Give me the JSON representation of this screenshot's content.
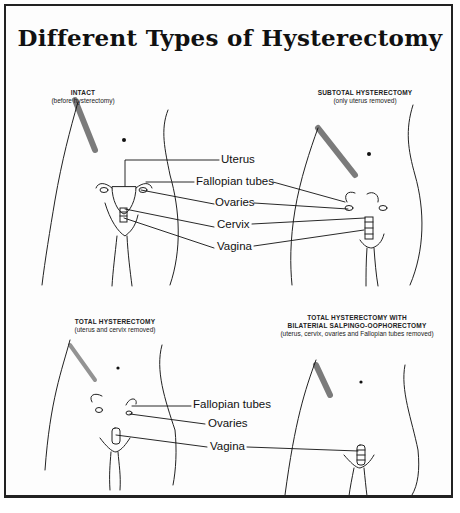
{
  "title": "Different Types of Hysterectomy",
  "panels": [
    {
      "heading": "INTACT",
      "subheading": "(before hysterectomy)"
    },
    {
      "heading": "SUBTOTAL HYSTERECTOMY",
      "subheading": "(only uterus removed)"
    },
    {
      "heading": "TOTAL HYSTERECTOMY",
      "subheading": "(uterus and cervix removed)"
    },
    {
      "heading_line1": "TOTAL HYSTERECTOMY WITH",
      "heading_line2": "BILATERIAL SALPINGO-OOPHORECTOMY",
      "subheading": "(uterus, cervix, ovaries and Fallopian tubes removed)"
    }
  ],
  "labels_top": {
    "uterus": "Uterus",
    "fallopian_tubes": "Fallopian tubes",
    "ovaries": "Ovaries",
    "cervix": "Cervix",
    "vagina": "Vagina"
  },
  "labels_bottom": {
    "fallopian_tubes": "Fallopian tubes",
    "ovaries": "Ovaries",
    "vagina": "Vagina"
  }
}
